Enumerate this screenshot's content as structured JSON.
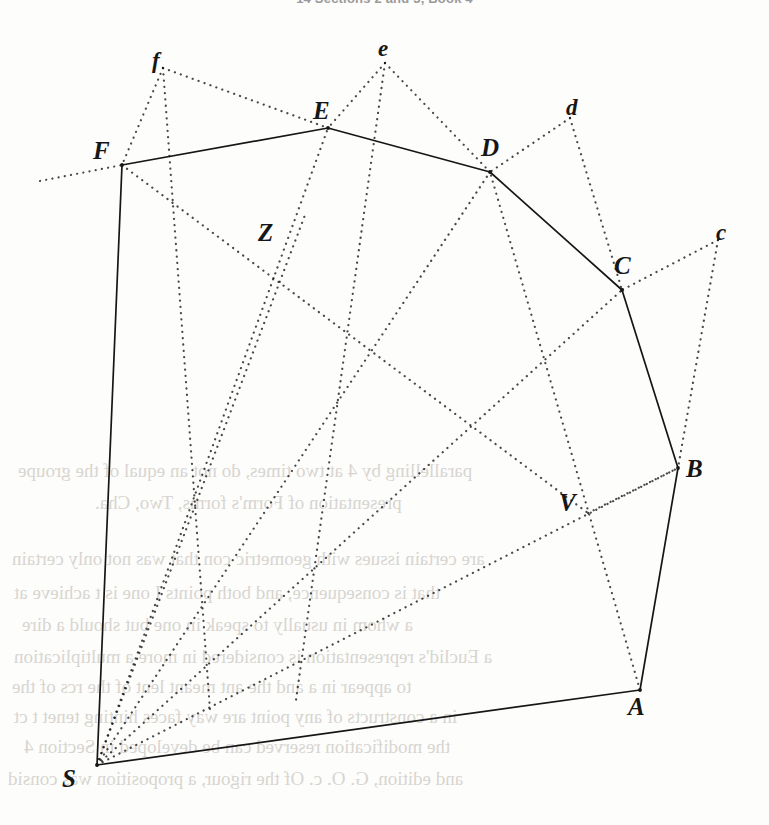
{
  "page": {
    "running_head": "14   Sections 2 and 3, Book 4",
    "width": 769,
    "height": 825,
    "background_color": "#fdfdfc",
    "ink_color": "#161616",
    "ghost_color": "#d8d5d0"
  },
  "figure": {
    "caption": "",
    "solid_outline_label": "S F E D C B A S",
    "vertices": [
      {
        "id": "F",
        "label": "F",
        "kind": "capital",
        "x": 122,
        "y": 165,
        "label_x": 93,
        "label_y": 137
      },
      {
        "id": "E",
        "label": "E",
        "kind": "capital",
        "x": 328,
        "y": 128,
        "label_x": 313,
        "label_y": 97
      },
      {
        "id": "D",
        "label": "D",
        "kind": "capital",
        "x": 490,
        "y": 172,
        "label_x": 481,
        "label_y": 134
      },
      {
        "id": "C",
        "label": "C",
        "kind": "capital",
        "x": 622,
        "y": 290,
        "label_x": 614,
        "label_y": 252
      },
      {
        "id": "B",
        "label": "B",
        "kind": "capital",
        "x": 678,
        "y": 468,
        "label_x": 686,
        "label_y": 455
      },
      {
        "id": "A",
        "label": "A",
        "kind": "capital",
        "x": 640,
        "y": 690,
        "label_x": 628,
        "label_y": 693
      },
      {
        "id": "S",
        "label": "S",
        "kind": "capital",
        "x": 97,
        "y": 765,
        "label_x": 62,
        "label_y": 765
      },
      {
        "id": "Z",
        "label": "Z",
        "kind": "capital",
        "x": 305,
        "y": 215,
        "label_x": 258,
        "label_y": 219
      },
      {
        "id": "V",
        "label": "V",
        "kind": "capital",
        "x": 588,
        "y": 513,
        "label_x": 559,
        "label_y": 489
      },
      {
        "id": "f",
        "label": "f",
        "kind": "lower",
        "x": 163,
        "y": 68,
        "label_x": 152,
        "label_y": 48
      },
      {
        "id": "e",
        "label": "e",
        "kind": "lower",
        "x": 385,
        "y": 63,
        "label_x": 378,
        "label_y": 36
      },
      {
        "id": "d",
        "label": "d",
        "kind": "lower",
        "x": 570,
        "y": 118,
        "label_x": 566,
        "label_y": 95
      },
      {
        "id": "c",
        "label": "c",
        "kind": "lower",
        "x": 718,
        "y": 240,
        "label_x": 716,
        "label_y": 220
      }
    ],
    "solid_edges": [
      {
        "from": "S",
        "to": "F",
        "name": "edge-S-F"
      },
      {
        "from": "F",
        "to": "E",
        "name": "edge-F-E"
      },
      {
        "from": "E",
        "to": "D",
        "name": "edge-E-D"
      },
      {
        "from": "D",
        "to": "C",
        "name": "edge-D-C"
      },
      {
        "from": "C",
        "to": "B",
        "name": "edge-C-B"
      },
      {
        "from": "B",
        "to": "A",
        "name": "edge-B-A"
      },
      {
        "from": "A",
        "to": "S",
        "name": "edge-A-S"
      }
    ],
    "dotted_edges": [
      {
        "from": "S",
        "to": "E",
        "name": "ray-S-E"
      },
      {
        "from": "S",
        "to": "D",
        "name": "ray-S-D"
      },
      {
        "from": "S",
        "to": "C",
        "name": "ray-S-C"
      },
      {
        "from": "S",
        "to": "B",
        "name": "ray-S-B"
      },
      {
        "from": "S",
        "to": "Z",
        "name": "ray-S-Z"
      },
      {
        "from": "f",
        "to": "F",
        "name": "line-f-F"
      },
      {
        "from": "f",
        "to": "E",
        "name": "line-f-E"
      },
      {
        "from": "e",
        "to": "E",
        "name": "line-e-E"
      },
      {
        "from": "e",
        "to": "D",
        "name": "line-e-D"
      },
      {
        "from": "d",
        "to": "D",
        "name": "line-d-D"
      },
      {
        "from": "d",
        "to": "C",
        "name": "line-d-C"
      },
      {
        "from": "c",
        "to": "C",
        "name": "line-c-C"
      },
      {
        "from": "c",
        "to": "B",
        "name": "line-c-B"
      },
      {
        "from": "F",
        "to": "V",
        "name": "line-F-V"
      },
      {
        "from": "V",
        "to": "B",
        "name": "line-V-B"
      },
      {
        "from": "A",
        "to": "D",
        "name": "line-A-D"
      }
    ],
    "dotted_free_segments": [
      {
        "name": "extension-left-of-F",
        "x1": 40,
        "y1": 181,
        "x2": 122,
        "y2": 165
      },
      {
        "name": "extension-f-through-F-down",
        "x1": 163,
        "y1": 68,
        "x2": 210,
        "y2": 710
      },
      {
        "name": "extension-e-through-E-down",
        "x1": 385,
        "y1": 63,
        "x2": 296,
        "y2": 700
      }
    ]
  },
  "ghost_text": {
    "note": "show-through from the reverse side of the leaf",
    "lines": [
      {
        "text": "parallelling by 4 at two times, do not an equal  of the groupe",
        "x": 18,
        "y": 460,
        "size": 19
      },
      {
        "text": "presentation of Form's forms, Two, Cha.",
        "x": 95,
        "y": 492,
        "size": 19
      },
      {
        "text": "are certain issues with geometric con that was not only certain",
        "x": 12,
        "y": 548,
        "size": 19
      },
      {
        "text": "that is consequence, and both points I one is t achieve at",
        "x": 14,
        "y": 582,
        "size": 19
      },
      {
        "text": "a  whom in usually to speak in one but should a dire",
        "x": 22,
        "y": 614,
        "size": 19
      },
      {
        "text": "a Euclid's representation is considered in more  a multiplication",
        "x": 14,
        "y": 646,
        "size": 19
      },
      {
        "text": "to appear in a  and  the ant meant lent of the  rcs of  the",
        "x": 12,
        "y": 676,
        "size": 19
      },
      {
        "text": "in a constructs of any point are way faces hinting tenet t ct",
        "x": 14,
        "y": 706,
        "size": 19
      },
      {
        "text": "the modification reserved can be developed in Section 4",
        "x": 24,
        "y": 736,
        "size": 19
      },
      {
        "text": "and edition, G. O. c. Of the  rigour, a  proposition was consid",
        "x": 8,
        "y": 768,
        "size": 19
      }
    ]
  }
}
